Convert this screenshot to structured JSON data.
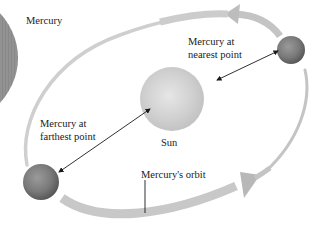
{
  "diagram": {
    "labels": {
      "mercury": "Mercury",
      "nearest_line1": "Mercury at",
      "nearest_line2": "nearest point",
      "farthest_line1": "Mercury at",
      "farthest_line2": "farthest point",
      "sun": "Sun",
      "orbit": "Mercury's orbit"
    },
    "colors": {
      "background": "#ffffff",
      "orbit_band": "#c8c8c8",
      "planet": "#7a7a7a",
      "sun": "#d4d4d4",
      "text": "#1a1a1a"
    }
  }
}
